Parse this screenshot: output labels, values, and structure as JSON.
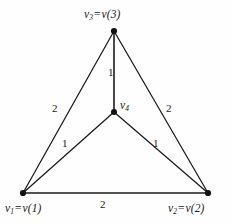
{
  "figure": {
    "type": "weighted-graph-diagram",
    "background_color": "#fefefe",
    "stroke_color": "#1a1a1a"
  },
  "nodes": [
    {
      "id": "v3",
      "label_parts": {
        "name": "v",
        "sub": "3",
        "eq": "=",
        "fn": "v(3)"
      },
      "label_text": "v₃ = v(3)",
      "x": 114,
      "y": 31
    },
    {
      "id": "v1",
      "label_parts": {
        "name": "v",
        "sub": "1",
        "eq": "=",
        "fn": "v(1)"
      },
      "label_text": "v₁ = v(1)",
      "x": 23,
      "y": 193
    },
    {
      "id": "v2",
      "label_parts": {
        "name": "v",
        "sub": "2",
        "eq": "=",
        "fn": "v(2)"
      },
      "label_text": "v₂ = v(2)",
      "x": 208,
      "y": 193
    },
    {
      "id": "v4",
      "label_parts": {
        "name": "v",
        "sub": "4",
        "eq": "",
        "fn": ""
      },
      "label_text": "v₄",
      "x": 114,
      "y": 112
    }
  ],
  "edges": [
    {
      "id": "v3-v4",
      "from": "v3",
      "to": "v4",
      "weight": "1"
    },
    {
      "id": "v1-v3",
      "from": "v1",
      "to": "v3",
      "weight": "2"
    },
    {
      "id": "v2-v3",
      "from": "v2",
      "to": "v3",
      "weight": "2"
    },
    {
      "id": "v1-v4",
      "from": "v1",
      "to": "v4",
      "weight": "1"
    },
    {
      "id": "v2-v4",
      "from": "v2",
      "to": "v4",
      "weight": "1"
    },
    {
      "id": "v1-v2",
      "from": "v1",
      "to": "v2",
      "weight": "2"
    }
  ]
}
